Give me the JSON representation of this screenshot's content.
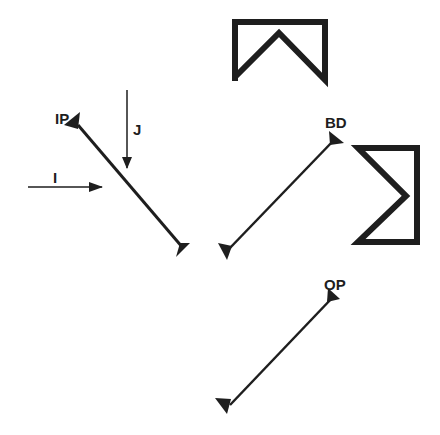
{
  "diagram": {
    "colors": {
      "ink": "#1e1e1e",
      "background": "#ffffff"
    },
    "labels": {
      "input_mirror": "IP",
      "beam_divider": "BD",
      "output_mirror": "OP",
      "beam_i": "I",
      "beam_j": "J"
    },
    "elements": [
      {
        "id": "input-mirror",
        "label": "IP",
        "type": "mirror",
        "from": [
          75,
          121
        ],
        "to": [
          186,
          252
        ]
      },
      {
        "id": "beam-divider",
        "label": "BD",
        "type": "mirror",
        "from": [
          224,
          254
        ],
        "to": [
          338,
          136
        ]
      },
      {
        "id": "output-mirror",
        "label": "OP",
        "type": "mirror",
        "from": [
          226,
          410
        ],
        "to": [
          337,
          292
        ]
      },
      {
        "id": "roof-reflector-top",
        "type": "roof-prism",
        "orientation": "down"
      },
      {
        "id": "roof-reflector-right",
        "type": "roof-prism",
        "orientation": "left"
      },
      {
        "id": "beam-i",
        "label": "I",
        "type": "arrow",
        "direction": "right"
      },
      {
        "id": "beam-j",
        "label": "J",
        "type": "arrow",
        "direction": "down"
      }
    ]
  }
}
